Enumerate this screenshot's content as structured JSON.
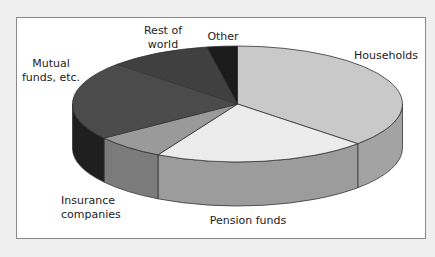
{
  "chart_data": {
    "type": "pie",
    "style": "3d-pie-grayscale",
    "title": "",
    "units": "share of total (%) — estimated from slice angles",
    "start_angle_deg": 0,
    "direction": "clockwise",
    "slices": [
      {
        "label": "Households",
        "value": 37,
        "top_color": "#c9c9c9",
        "side_color": "#a3a3a3"
      },
      {
        "label": "Pension funds",
        "value": 21,
        "top_color": "#ececec",
        "side_color": "#9c9c9c"
      },
      {
        "label": "Insurance companies",
        "value": 7,
        "top_color": "#9a9a9a",
        "side_color": "#7b7b7b"
      },
      {
        "label": "Mutual funds, etc.",
        "value": 22,
        "top_color": "#4b4b4b",
        "side_color": "#1f1f1f"
      },
      {
        "label": "Rest of world",
        "value": 10,
        "top_color": "#404040",
        "side_color": "#2a2a2a"
      },
      {
        "label": "Other",
        "value": 3,
        "top_color": "#1b1b1b",
        "side_color": "#111111"
      }
    ],
    "legend": "none (direct labels)",
    "grid": false
  },
  "labels": {
    "households": "Households",
    "pension": "Pension funds",
    "insurance": "Insurance\ncompanies",
    "mutual": "Mutual\nfunds, etc.",
    "rest": "Rest of\nworld",
    "other": "Other"
  },
  "geometry": {
    "cx": 237.5,
    "cy": 104,
    "rx": 165,
    "ry": 58,
    "depth": 44
  }
}
